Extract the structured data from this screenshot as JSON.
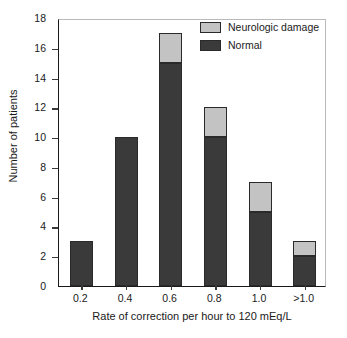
{
  "chart_data": {
    "type": "bar",
    "title": "",
    "subtitle": "",
    "xlabel": "Rate of correction per hour to 120 mEq/L",
    "ylabel": "Number of patients",
    "categories": [
      "0.2",
      "0.4",
      "0.6",
      "0.8",
      "1.0",
      ">1.0"
    ],
    "series": [
      {
        "name": "Normal",
        "color": "#3a3a3a",
        "values": [
          3,
          10,
          15,
          10,
          5,
          2
        ]
      },
      {
        "name": "Neurologic damage",
        "color": "#c3c3c3",
        "values": [
          0,
          0,
          2,
          2,
          2,
          1
        ]
      }
    ],
    "totals": [
      3,
      10,
      17,
      12,
      7,
      3
    ],
    "stacked": true,
    "ylim": [
      0,
      18
    ],
    "yticks": [
      0,
      2,
      4,
      6,
      8,
      10,
      12,
      14,
      16,
      18
    ],
    "ytick_labels": [
      "0",
      "2",
      "4",
      "6",
      "8",
      "10",
      "12",
      "14",
      "16",
      "18"
    ],
    "grid": false,
    "legend_position": "top-right",
    "legend_entries": [
      "Neurologic damage",
      "Normal"
    ]
  },
  "legend": {
    "items": [
      {
        "label": "Neurologic damage",
        "color": "#c3c3c3"
      },
      {
        "label": "Normal",
        "color": "#3a3a3a"
      }
    ]
  },
  "axes": {
    "x_title": "Rate of correction per hour to 120 mEq/L",
    "y_title": "Number of patients"
  }
}
